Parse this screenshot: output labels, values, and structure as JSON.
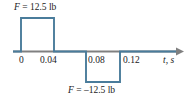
{
  "figure": {
    "name": "force-versus-time-pulse-diagram",
    "axis_label": "t, s",
    "top_annotation": "F = 12.5 lb",
    "bottom_annotation": "F = –12.5 lb",
    "tick_labels": [
      "0",
      "0.04",
      "0.08",
      "0.12"
    ],
    "colors": {
      "signal": "#4a7c9b",
      "axis": "#808080",
      "text": "#1a1a1a",
      "background": "#ffffff"
    }
  },
  "chart_data": {
    "type": "line",
    "title": "",
    "subtitle": "",
    "xlabel": "t, s",
    "ylabel": "F, lb",
    "xlim": [
      -0.005,
      0.175
    ],
    "ylim": [
      -16,
      16
    ],
    "grid": false,
    "legend": null,
    "x_ticks": [
      0,
      0.04,
      0.08,
      0.12
    ],
    "x_tick_labels": [
      "0",
      "0.04",
      "0.08",
      "0.12"
    ],
    "y_ticks": [],
    "y_tick_labels": [],
    "series": [
      {
        "name": "F(t)",
        "color": "#4a7c9b",
        "x": [
          -0.005,
          0.0,
          0.0,
          0.04,
          0.04,
          0.08,
          0.08,
          0.12,
          0.12,
          0.175
        ],
        "values": [
          0,
          0,
          12.5,
          12.5,
          0,
          0,
          -12.5,
          -12.5,
          0,
          0
        ]
      }
    ],
    "annotations": [
      {
        "text": "F = 12.5 lb",
        "x": 0.0,
        "y": 12.5,
        "position": "above-left"
      },
      {
        "text": "F = –12.5 lb",
        "x": 0.1,
        "y": -12.5,
        "position": "below"
      }
    ]
  }
}
